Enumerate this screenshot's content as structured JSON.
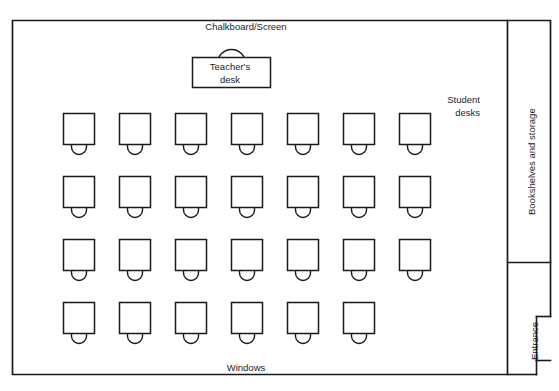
{
  "diagram": {
    "title_fragment_top": "",
    "room": {
      "chalkboard_label": "Chalkboard/Screen",
      "windows_label": "Windows",
      "bookshelves_label": "Bookshelves and storage",
      "entrance_label": "Entrance"
    },
    "teacher_desk": {
      "line1": "Teacher's",
      "line2": "desk"
    },
    "student_desks": {
      "line1": "Student",
      "line2": "desks",
      "total_count": 27,
      "rows": [
        {
          "row": 1,
          "count": 7,
          "y": 113
        },
        {
          "row": 2,
          "count": 7,
          "y": 176
        },
        {
          "row": 3,
          "count": 7,
          "y": 239
        },
        {
          "row": 4,
          "count": 6,
          "y": 302
        }
      ],
      "column_x": [
        63,
        119,
        175,
        231,
        287,
        343,
        399
      ],
      "desk_width": 31,
      "desk_height": 31,
      "chair_width": 15,
      "chair_height": 11
    },
    "colors": {
      "ink": "#1a1a1a",
      "paper": "#ffffff",
      "ghost": "#c9c9cf"
    }
  }
}
